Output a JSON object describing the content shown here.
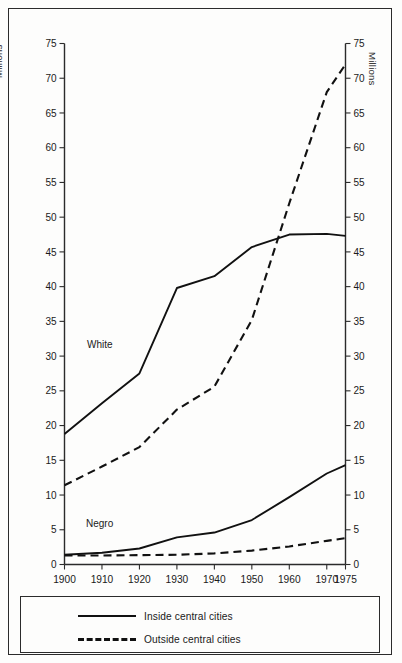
{
  "chart_data": {
    "type": "line",
    "title": "",
    "subtitle": "",
    "xlabel": "",
    "ylabel": "Millions",
    "ylabel_right": "Millions",
    "xlim": [
      1900,
      1975
    ],
    "ylim": [
      0,
      75
    ],
    "grid": false,
    "legend_position": "bottom",
    "x_ticks": [
      "1900",
      "1910",
      "1920",
      "1930",
      "1940",
      "1950",
      "1960",
      "1970",
      "1975"
    ],
    "x_tick_values": [
      1900,
      1910,
      1920,
      1930,
      1940,
      1950,
      1960,
      1970,
      1975
    ],
    "y_ticks": [
      "0",
      "5",
      "10",
      "15",
      "20",
      "25",
      "30",
      "35",
      "40",
      "45",
      "50",
      "55",
      "60",
      "65",
      "70",
      "75"
    ],
    "y_tick_values": [
      0,
      5,
      10,
      15,
      20,
      25,
      30,
      35,
      40,
      45,
      50,
      55,
      60,
      65,
      70,
      75
    ],
    "annotations": [
      {
        "text": "White",
        "x": 1903,
        "y": 32.2
      },
      {
        "text": "Negro",
        "x": 1903,
        "y": 6.5
      }
    ],
    "legend": [
      {
        "label": "Inside central cities",
        "style": "solid"
      },
      {
        "label": "Outside central cities",
        "style": "dashed"
      }
    ],
    "series": [
      {
        "name": "White inside central cities",
        "group": "White",
        "style": "solid",
        "x": [
          1900,
          1910,
          1920,
          1930,
          1940,
          1950,
          1960,
          1970,
          1975
        ],
        "values": [
          18.8,
          23.2,
          27.5,
          39.8,
          41.5,
          45.7,
          47.5,
          47.6,
          47.3
        ]
      },
      {
        "name": "White outside central cities",
        "group": "White",
        "style": "dashed",
        "x": [
          1900,
          1910,
          1920,
          1930,
          1940,
          1950,
          1960,
          1970,
          1975
        ],
        "values": [
          11.4,
          14.1,
          16.9,
          22.3,
          25.6,
          35.2,
          52.0,
          68.0,
          72.0
        ]
      },
      {
        "name": "Negro inside central cities",
        "group": "Negro",
        "style": "solid",
        "x": [
          1900,
          1910,
          1920,
          1930,
          1940,
          1950,
          1960,
          1970,
          1975
        ],
        "values": [
          1.4,
          1.7,
          2.3,
          3.9,
          4.6,
          6.4,
          9.7,
          13.1,
          14.3
        ]
      },
      {
        "name": "Negro outside central cities",
        "group": "Negro",
        "style": "dashed",
        "x": [
          1900,
          1910,
          1920,
          1930,
          1940,
          1950,
          1960,
          1970,
          1975
        ],
        "values": [
          1.3,
          1.3,
          1.35,
          1.4,
          1.6,
          2.0,
          2.6,
          3.4,
          3.8
        ]
      }
    ]
  },
  "axes": {
    "left_title": "Millions",
    "right_title": "Millions"
  },
  "legend": {
    "items": [
      {
        "label": "Inside central cities",
        "style": "solid"
      },
      {
        "label": "Outside central cities",
        "style": "dashed"
      }
    ]
  },
  "labels": {
    "white": "White",
    "negro": "Negro"
  },
  "colors": {
    "line": "#111111",
    "axis": "#2b2b2b",
    "text": "#1a1a1a",
    "background": "#fdfdfc"
  }
}
